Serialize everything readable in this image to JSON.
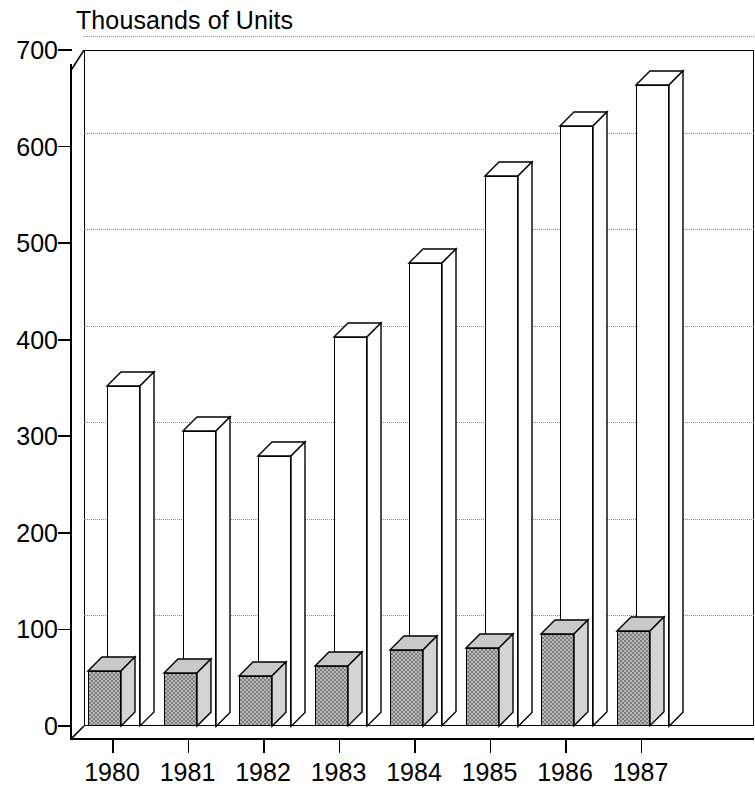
{
  "chart_data": {
    "type": "bar",
    "title": "Thousands of Units",
    "xlabel": "",
    "ylabel": "Thousands of Units",
    "ylim": [
      0,
      700
    ],
    "ytick_values": [
      0,
      100,
      200,
      300,
      400,
      500,
      600,
      700
    ],
    "ytick_labels": [
      "0",
      "100",
      "200",
      "300",
      "400",
      "500",
      "600",
      "700"
    ],
    "categories": [
      "1980",
      "1981",
      "1982",
      "1983",
      "1984",
      "1985",
      "1986",
      "1987"
    ],
    "grid": true,
    "legend": "none",
    "style": "3d-bar",
    "series": [
      {
        "name": "shaded-series",
        "fill": "gray-checker",
        "values": [
          57,
          55,
          52,
          62,
          79,
          81,
          95,
          98
        ]
      },
      {
        "name": "open-series",
        "fill": "white",
        "values": [
          352,
          306,
          280,
          403,
          479,
          570,
          621,
          664
        ]
      }
    ],
    "colors": {
      "axis": "#000000",
      "gridline": "#8a8a8a",
      "open_bar_fill": "#ffffff",
      "shaded_bar_fill": "#b9b9b9",
      "shaded_bar_hatch": "#7d7d7d",
      "background": "#ffffff"
    }
  }
}
